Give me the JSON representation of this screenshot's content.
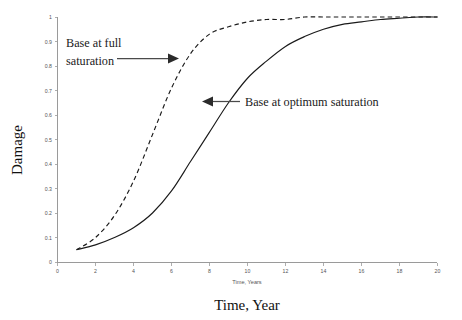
{
  "chart_data": {
    "type": "line",
    "title": "",
    "xlabel": "Time, Year",
    "ylabel": "Damage",
    "x_inner_label": "Time, Years",
    "xlim": [
      0,
      20
    ],
    "ylim": [
      0,
      1
    ],
    "xticks": [
      0,
      2,
      4,
      6,
      8,
      10,
      12,
      14,
      16,
      18,
      20
    ],
    "xtick_labels": [
      "0",
      "2",
      "4",
      "6",
      "8",
      "10",
      "12",
      "14",
      "16",
      "18",
      "20"
    ],
    "yticks": [
      0,
      0.1,
      0.2,
      0.3,
      0.4,
      0.5,
      0.6,
      0.7,
      0.8,
      0.9,
      1
    ],
    "ytick_labels": [
      "0",
      "0.1",
      "0.2",
      "0.3",
      "0.4",
      "0.5",
      "0.6",
      "0.7",
      "0.8",
      "0.9",
      "1"
    ],
    "grid": false,
    "legend": "none",
    "x": [
      1,
      2,
      3,
      4,
      5,
      6,
      7,
      8,
      9,
      10,
      11,
      12,
      13,
      14,
      15,
      16,
      17,
      18,
      19,
      20
    ],
    "series": [
      {
        "name": "Base at full saturation",
        "style": "dashed",
        "color": "#1a1a1a",
        "values": [
          0.05,
          0.1,
          0.19,
          0.33,
          0.52,
          0.71,
          0.85,
          0.93,
          0.96,
          0.98,
          0.99,
          0.99,
          1.0,
          1.0,
          1.0,
          1.0,
          1.0,
          1.0,
          1.0,
          1.0
        ]
      },
      {
        "name": "Base at optimum saturation",
        "style": "solid",
        "color": "#1a1a1a",
        "values": [
          0.05,
          0.07,
          0.1,
          0.14,
          0.2,
          0.29,
          0.41,
          0.53,
          0.65,
          0.75,
          0.82,
          0.88,
          0.92,
          0.95,
          0.97,
          0.98,
          0.99,
          0.995,
          1.0,
          1.0
        ]
      }
    ],
    "annotations": [
      {
        "text_line1": "Base at full",
        "text_line2": "saturation",
        "text": "Base at full saturation",
        "arrow_direction": "right",
        "points_to_series": "Base at full saturation",
        "target_x": 6.2,
        "target_y": 0.85
      },
      {
        "text_line1": "Base at optimum saturation",
        "text_line2": "",
        "text": "Base at optimum saturation",
        "arrow_direction": "left",
        "points_to_series": "Base at optimum saturation",
        "target_x": 9.0,
        "target_y": 0.66
      }
    ]
  },
  "axis": {
    "x_title": "Time, Year",
    "y_title": "Damage",
    "x_inner_title": "Time, Years"
  },
  "colors": {
    "axis": "#9a9a9a",
    "curve": "#1a1a1a",
    "arrow": "#4a4a4a",
    "tick_text": "#555555",
    "background": "#ffffff"
  }
}
